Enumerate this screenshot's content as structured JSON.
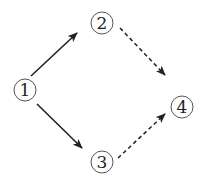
{
  "diagram": {
    "type": "directed-graph",
    "nodes": [
      {
        "id": "1",
        "label": "1",
        "x": 25,
        "y": 90
      },
      {
        "id": "2",
        "label": "2",
        "x": 102,
        "y": 23
      },
      {
        "id": "3",
        "label": "3",
        "x": 102,
        "y": 162
      },
      {
        "id": "4",
        "label": "4",
        "x": 182,
        "y": 107
      }
    ],
    "edges": [
      {
        "from": "1",
        "to": "2",
        "style": "solid"
      },
      {
        "from": "1",
        "to": "3",
        "style": "solid"
      },
      {
        "from": "2",
        "to": "4",
        "style": "dashed"
      },
      {
        "from": "3",
        "to": "4",
        "style": "dashed"
      }
    ],
    "colors": {
      "stroke": "#222222",
      "circle": "#555555",
      "background": "#ffffff"
    }
  }
}
